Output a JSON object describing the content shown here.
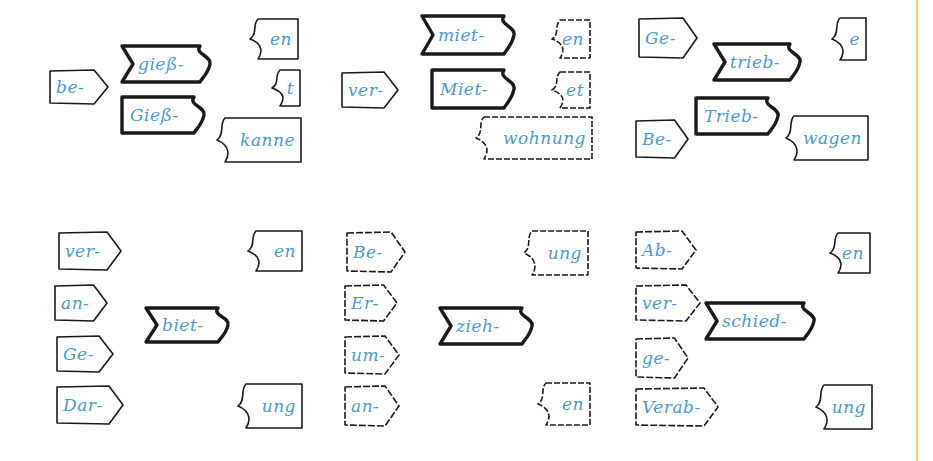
{
  "diagram": {
    "colors": {
      "text": "#4a9ad4",
      "outline": "#1a1a1a",
      "divider": "#f3cf6e",
      "background": "#ffffff"
    },
    "groups": [
      {
        "id": "giess",
        "prefixes": [
          {
            "label": "be-",
            "x": 48,
            "y": 68,
            "w": 60,
            "h": 38
          }
        ],
        "stems": [
          {
            "label": "gieß-",
            "variant": "verb",
            "x": 120,
            "y": 44,
            "w": 92,
            "h": 40
          },
          {
            "label": "Gieß-",
            "variant": "noun",
            "x": 120,
            "y": 95,
            "w": 86,
            "h": 40
          }
        ],
        "suffixes": [
          {
            "label": "en",
            "x": 246,
            "y": 17,
            "w": 54,
            "h": 44
          },
          {
            "label": "t",
            "x": 268,
            "y": 68,
            "w": 34,
            "h": 40
          },
          {
            "label": "kanne",
            "x": 213,
            "y": 116,
            "w": 90,
            "h": 48
          }
        ]
      },
      {
        "id": "miet",
        "prefixes": [
          {
            "label": "ver-",
            "x": 340,
            "y": 70,
            "w": 58,
            "h": 40
          }
        ],
        "stems": [
          {
            "label": "miet-",
            "variant": "verb",
            "x": 420,
            "y": 14,
            "w": 96,
            "h": 42
          },
          {
            "label": "Miet-",
            "variant": "noun",
            "x": 430,
            "y": 68,
            "w": 86,
            "h": 42
          }
        ],
        "suffixes": [
          {
            "label": "en",
            "x": 548,
            "y": 18,
            "w": 44,
            "h": 42
          },
          {
            "label": "et",
            "x": 548,
            "y": 70,
            "w": 44,
            "h": 40
          },
          {
            "label": "wohnung",
            "x": 472,
            "y": 115,
            "w": 122,
            "h": 46
          }
        ]
      },
      {
        "id": "trieb",
        "prefixes": [
          {
            "label": "Ge-",
            "x": 637,
            "y": 16,
            "w": 60,
            "h": 44
          },
          {
            "label": "Be-",
            "x": 634,
            "y": 118,
            "w": 54,
            "h": 42
          }
        ],
        "stems": [
          {
            "label": "trieb-",
            "variant": "verb",
            "x": 712,
            "y": 42,
            "w": 90,
            "h": 40
          },
          {
            "label": "Trieb-",
            "variant": "noun",
            "x": 694,
            "y": 96,
            "w": 86,
            "h": 40
          }
        ],
        "suffixes": [
          {
            "label": "e",
            "x": 828,
            "y": 16,
            "w": 40,
            "h": 46
          },
          {
            "label": "wagen",
            "x": 782,
            "y": 114,
            "w": 88,
            "h": 48
          }
        ]
      },
      {
        "id": "biet",
        "prefixes": [
          {
            "label": "ver-",
            "x": 57,
            "y": 230,
            "w": 64,
            "h": 42
          },
          {
            "label": "an-",
            "x": 53,
            "y": 283,
            "w": 54,
            "h": 40
          },
          {
            "label": "Ge-",
            "x": 55,
            "y": 334,
            "w": 58,
            "h": 40
          },
          {
            "label": "Dar-",
            "x": 55,
            "y": 384,
            "w": 68,
            "h": 42
          }
        ],
        "stems": [
          {
            "label": "biet-",
            "variant": "verb",
            "x": 144,
            "y": 306,
            "w": 86,
            "h": 38
          }
        ],
        "suffixes": [
          {
            "label": "en",
            "x": 244,
            "y": 229,
            "w": 60,
            "h": 44
          },
          {
            "label": "ung",
            "x": 234,
            "y": 382,
            "w": 70,
            "h": 48
          }
        ]
      },
      {
        "id": "zieh",
        "prefixes": [
          {
            "label": "Be-",
            "x": 345,
            "y": 230,
            "w": 60,
            "h": 44
          },
          {
            "label": "Er-",
            "x": 343,
            "y": 283,
            "w": 54,
            "h": 40
          },
          {
            "label": "um-",
            "x": 343,
            "y": 334,
            "w": 56,
            "h": 42
          },
          {
            "label": "an-",
            "x": 343,
            "y": 384,
            "w": 56,
            "h": 44
          }
        ],
        "stems": [
          {
            "label": "zieh-",
            "variant": "verb",
            "x": 438,
            "y": 306,
            "w": 96,
            "h": 40
          }
        ],
        "suffixes": [
          {
            "label": "ung",
            "x": 520,
            "y": 229,
            "w": 70,
            "h": 48
          },
          {
            "label": "en",
            "x": 534,
            "y": 381,
            "w": 58,
            "h": 46
          }
        ]
      },
      {
        "id": "schied",
        "prefixes": [
          {
            "label": "Ab-",
            "x": 634,
            "y": 229,
            "w": 62,
            "h": 42
          },
          {
            "label": "ver-",
            "x": 634,
            "y": 283,
            "w": 66,
            "h": 40
          },
          {
            "label": "ge-",
            "x": 634,
            "y": 336,
            "w": 54,
            "h": 44
          },
          {
            "label": "Verab-",
            "x": 634,
            "y": 386,
            "w": 84,
            "h": 42
          }
        ],
        "stems": [
          {
            "label": "schied-",
            "variant": "verb",
            "x": 704,
            "y": 301,
            "w": 112,
            "h": 40
          }
        ],
        "suffixes": [
          {
            "label": "en",
            "x": 826,
            "y": 231,
            "w": 46,
            "h": 44
          },
          {
            "label": "ung",
            "x": 812,
            "y": 383,
            "w": 62,
            "h": 48
          }
        ]
      }
    ]
  }
}
